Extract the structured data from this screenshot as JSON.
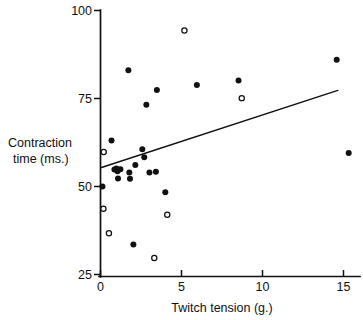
{
  "chart_data": {
    "type": "scatter",
    "title": "",
    "xlabel": "Twitch tension (g.)",
    "ylabel_line1": "Contraction",
    "ylabel_line2": "time (ms.)",
    "ylabel": "Contraction time (ms.)",
    "xlim": [
      0,
      16.2
    ],
    "ylim": [
      22,
      100
    ],
    "xticks": [
      0,
      5,
      10,
      15
    ],
    "xtick_labels": [
      "0",
      "5",
      "10",
      "15"
    ],
    "yticks": [
      25,
      50,
      75,
      100
    ],
    "ytick_labels": [
      "25",
      "50",
      "75",
      "100"
    ],
    "grid": false,
    "legend": "none",
    "series": [
      {
        "name": "filled",
        "marker": "filled-circle",
        "color": "#111111",
        "points": [
          [
            0.12,
            50.0
          ],
          [
            0.68,
            63.1
          ],
          [
            0.86,
            54.8
          ],
          [
            0.98,
            55.1
          ],
          [
            1.05,
            54.3
          ],
          [
            1.08,
            52.3
          ],
          [
            1.23,
            54.9
          ],
          [
            1.72,
            83.0
          ],
          [
            1.78,
            54.0
          ],
          [
            1.82,
            52.2
          ],
          [
            2.03,
            33.5
          ],
          [
            2.15,
            56.1
          ],
          [
            2.58,
            60.6
          ],
          [
            2.7,
            58.3
          ],
          [
            2.83,
            73.2
          ],
          [
            3.02,
            54.0
          ],
          [
            3.42,
            54.2
          ],
          [
            3.48,
            77.4
          ],
          [
            4.0,
            48.4
          ],
          [
            5.95,
            78.8
          ],
          [
            8.52,
            80.1
          ],
          [
            14.58,
            86.0
          ],
          [
            15.32,
            59.5
          ]
        ]
      },
      {
        "name": "open",
        "marker": "open-circle",
        "color": "#111111",
        "points": [
          [
            0.18,
            43.7
          ],
          [
            0.2,
            59.8
          ],
          [
            0.52,
            36.7
          ],
          [
            3.32,
            29.7
          ],
          [
            4.12,
            42.0
          ],
          [
            5.18,
            94.3
          ],
          [
            8.72,
            75.1
          ]
        ]
      }
    ],
    "fit_line": {
      "name": "regression-line",
      "x_start": 0.06,
      "y_start": 55.4,
      "x_end": 14.65,
      "y_end": 77.3
    }
  }
}
